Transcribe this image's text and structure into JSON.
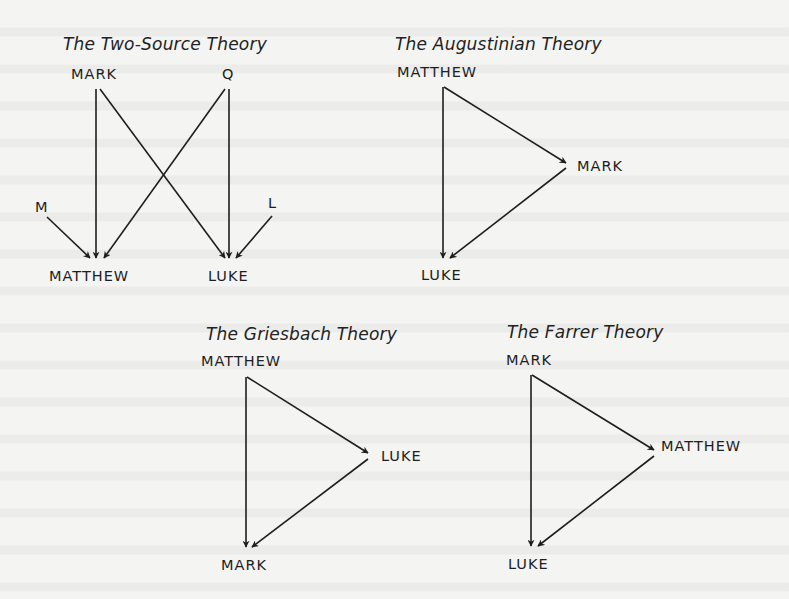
{
  "diagrams": {
    "two_source": {
      "title": "The Two-Source Theory",
      "nodes": {
        "mark": "MARK",
        "q": "Q",
        "m": "M",
        "l": "L",
        "matthew": "MATTHEW",
        "luke": "LUKE"
      },
      "edges": [
        [
          "MARK",
          "MATTHEW"
        ],
        [
          "MARK",
          "LUKE"
        ],
        [
          "Q",
          "MATTHEW"
        ],
        [
          "Q",
          "LUKE"
        ],
        [
          "M",
          "MATTHEW"
        ],
        [
          "L",
          "LUKE"
        ]
      ]
    },
    "augustinian": {
      "title": "The Augustinian Theory",
      "nodes": {
        "matthew": "MATTHEW",
        "mark": "MARK",
        "luke": "LUKE"
      },
      "edges": [
        [
          "MATTHEW",
          "MARK"
        ],
        [
          "MATTHEW",
          "LUKE"
        ],
        [
          "MARK",
          "LUKE"
        ]
      ]
    },
    "griesbach": {
      "title": "The Griesbach Theory",
      "nodes": {
        "matthew": "MATTHEW",
        "luke": "LUKE",
        "mark": "MARK"
      },
      "edges": [
        [
          "MATTHEW",
          "LUKE"
        ],
        [
          "MATTHEW",
          "MARK"
        ],
        [
          "LUKE",
          "MARK"
        ]
      ]
    },
    "farrer": {
      "title": "The Farrer Theory",
      "nodes": {
        "mark": "MARK",
        "matthew": "MATTHEW",
        "luke": "LUKE"
      },
      "edges": [
        [
          "MARK",
          "MATTHEW"
        ],
        [
          "MARK",
          "LUKE"
        ],
        [
          "MATTHEW",
          "LUKE"
        ]
      ]
    }
  },
  "colors": {
    "background": "#f4f4f2",
    "ink": "#1e1e1e"
  }
}
